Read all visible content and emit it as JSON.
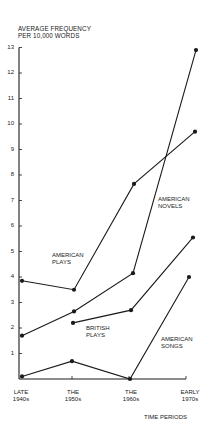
{
  "chart_data": {
    "type": "line",
    "title": "",
    "ylabel": "AVERAGE FREQUENCY PER 10,000 WORDS",
    "ylabel_lines": [
      "AVERAGE FREQUENCY",
      "PER 10,000 WORDS"
    ],
    "xlabel": "TIME PERIODS",
    "categories": [
      "LATE 1940s",
      "THE 1950s",
      "THE 1960s",
      "EARLY 1970s"
    ],
    "category_lines": [
      [
        "LATE",
        "1940s"
      ],
      [
        "THE",
        "1950s"
      ],
      [
        "THE",
        "1960s"
      ],
      [
        "EARLY",
        "1970s"
      ]
    ],
    "ylim": [
      0,
      13
    ],
    "yticks": [
      1,
      2,
      3,
      4,
      5,
      6,
      7,
      8,
      9,
      10,
      11,
      12,
      13
    ],
    "grid": false,
    "legend": "inline labels",
    "series": [
      {
        "name": "AMERICAN PLAYS",
        "label_lines": [
          "AMERICAN",
          "PLAYS"
        ],
        "values": [
          3.85,
          3.5,
          7.65,
          9.7
        ]
      },
      {
        "name": "AMERICAN NOVELS",
        "label_lines": [
          "AMERICAN",
          "NOVELS"
        ],
        "values": [
          1.7,
          2.65,
          4.15,
          12.9
        ]
      },
      {
        "name": "BRITISH PLAYS",
        "label_lines": [
          "BRITISH",
          "PLAYS"
        ],
        "values": [
          null,
          2.2,
          2.7,
          5.55
        ]
      },
      {
        "name": "AMERICAN SONGS",
        "label_lines": [
          "AMERICAN",
          "SONGS"
        ],
        "values": [
          0.1,
          0.7,
          0.0,
          4.0
        ]
      }
    ]
  }
}
